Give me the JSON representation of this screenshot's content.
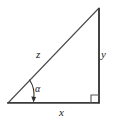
{
  "figure": {
    "type": "right-triangle-diagram",
    "background_color": "#ffffff",
    "stroke_color": "#3a3a3a",
    "hypotenuse_color": "#4a4a4a",
    "label_color": "#1a1a1a",
    "vertices": {
      "left": {
        "x": 8,
        "y": 103
      },
      "top_right": {
        "x": 99,
        "y": 8
      },
      "bottom_right": {
        "x": 99,
        "y": 103
      }
    },
    "sides": [
      {
        "name": "base",
        "label": "x",
        "from": "left",
        "to": "bottom_right",
        "orientation": "horizontal"
      },
      {
        "name": "vertical",
        "label": "y",
        "from": "bottom_right",
        "to": "top_right",
        "orientation": "vertical"
      },
      {
        "name": "hypotenuse",
        "label": "z",
        "from": "left",
        "to": "top_right",
        "orientation": "diagonal"
      }
    ],
    "labels": {
      "hypotenuse": "z",
      "vertical": "y",
      "base": "x",
      "angle": "α"
    },
    "markers": {
      "right_angle": {
        "at": "bottom_right",
        "size": 8,
        "symbol": "square"
      },
      "angle_arc": {
        "at": "left",
        "symbol": "arc-with-arrow",
        "points_to": "base"
      }
    }
  }
}
